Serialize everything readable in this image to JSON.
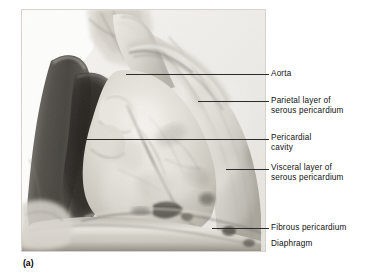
{
  "figure": {
    "panel_letter": "(a)",
    "type": "anatomical-photograph",
    "image_style": "black-and-white cadaver photograph"
  },
  "labels": [
    {
      "id": "aorta",
      "text": "Aorta"
    },
    {
      "id": "parietal",
      "text": "Parietal layer of\nserous pericardium"
    },
    {
      "id": "pericardial",
      "text": "Pericardial\ncavity"
    },
    {
      "id": "visceral",
      "text": "Visceral layer of\nserous pericardium"
    },
    {
      "id": "fibrous",
      "text": "Fibrous pericardium"
    },
    {
      "id": "diaphragm",
      "text": "Diaphragm"
    }
  ],
  "colors": {
    "background": "#ffffff",
    "text": "#111111",
    "leader_line": "#2b2b2b",
    "photo_light": "#e8e6e0",
    "photo_mid": "#b9b5ad",
    "photo_dark": "#4a4742",
    "photo_shadow": "#2a2826"
  }
}
